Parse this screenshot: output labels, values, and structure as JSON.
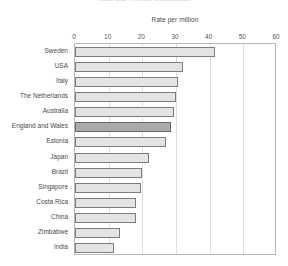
{
  "chart_data": {
    "type": "bar",
    "orientation": "horizontal",
    "title": "Rate per million population",
    "axis_title": "Rate per million",
    "xlabel": "Rate per million",
    "ylabel": "",
    "xlim": [
      0,
      60
    ],
    "xticks": [
      0,
      10,
      20,
      30,
      40,
      50,
      60
    ],
    "grid": true,
    "legend": "none",
    "highlight_category": "England and Wales",
    "categories": [
      "Sweden",
      "USA",
      "Italy",
      "The Netherlands",
      "Australia",
      "England and Wales",
      "Estonia",
      "Japan",
      "Brazil",
      "Singapore",
      "Costa Rica",
      "China",
      "Zimbabwe",
      "India"
    ],
    "values": [
      41.5,
      32.0,
      30.5,
      30.0,
      29.5,
      28.5,
      27.0,
      22.0,
      20.0,
      19.5,
      18.0,
      18.0,
      13.5,
      11.5
    ]
  },
  "tick_labels": [
    "0",
    "10",
    "20",
    "30",
    "40",
    "50",
    "60"
  ]
}
